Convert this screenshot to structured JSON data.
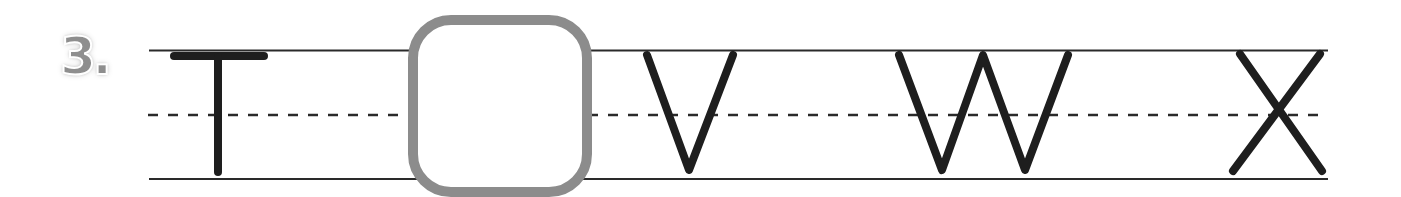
{
  "exercise": {
    "number_label": "3.",
    "sequence": [
      "T",
      "",
      "V",
      "W",
      "X"
    ],
    "blank_position": 1,
    "missing_letter_hint": "U"
  },
  "colors": {
    "letter_stroke": "#1e1e1e",
    "guide_line": "#2a2a2a",
    "answer_box_border": "#8c8c8c",
    "number_label": "#8e8e8e"
  }
}
